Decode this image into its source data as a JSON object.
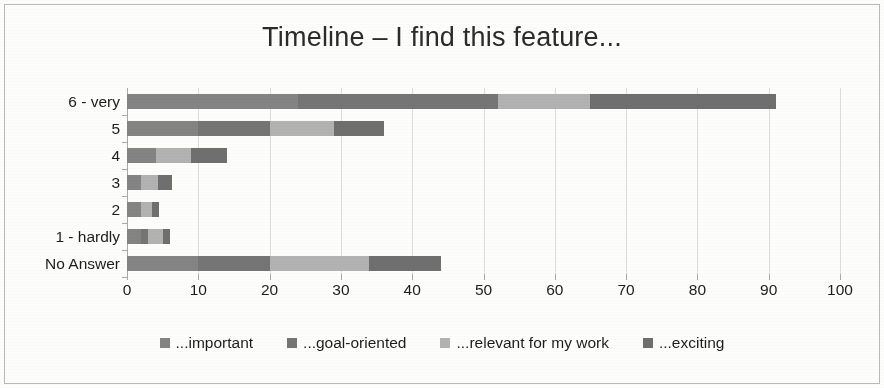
{
  "chart_data": {
    "type": "bar",
    "orientation": "horizontal",
    "stacked": true,
    "title": "Timeline – I find this feature...",
    "xlabel": "",
    "ylabel": "",
    "xlim": [
      0,
      100
    ],
    "xticks": [
      0,
      10,
      20,
      30,
      40,
      50,
      60,
      70,
      80,
      90,
      100
    ],
    "xtick_labels": [
      "0",
      "10",
      "20",
      "30",
      "40",
      "50",
      "60",
      "70",
      "80",
      "90",
      "100"
    ],
    "grid": true,
    "legend_position": "bottom",
    "categories": [
      "6 - very",
      "5",
      "4",
      "3",
      "2",
      "1 - hardly",
      "No Answer"
    ],
    "series": [
      {
        "name": "...important",
        "color": "#848484",
        "values": [
          24,
          10,
          4,
          2,
          2,
          2,
          10
        ]
      },
      {
        "name": "...goal-oriented",
        "color": "#757575",
        "values": [
          28,
          10,
          0,
          0,
          0,
          1,
          10
        ]
      },
      {
        "name": "...relevant for my work",
        "color": "#b2b2b2",
        "values": [
          13,
          9,
          5,
          2.4,
          1.5,
          2,
          14
        ]
      },
      {
        "name": "...exciting",
        "color": "#6f6f6f",
        "values": [
          26,
          7,
          5,
          1.9,
          1,
          1,
          10
        ]
      }
    ],
    "totals": [
      91,
      36,
      14,
      6.3,
      4.5,
      6,
      44
    ]
  },
  "legend": {
    "items": [
      {
        "label": "...important",
        "color": "#848484",
        "swatch": "square-swatch"
      },
      {
        "label": "...goal-oriented",
        "color": "#757575",
        "swatch": "square-swatch"
      },
      {
        "label": "...relevant for my work",
        "color": "#b2b2b2",
        "swatch": "square-swatch"
      },
      {
        "label": "...exciting",
        "color": "#6f6f6f",
        "swatch": "square-swatch"
      }
    ]
  },
  "style": {
    "background": "#fdfdfc",
    "border_color": "#b9b9b9",
    "grid_color": "#dcdcdc",
    "axis_color": "#a8a8a8",
    "text_color": "#1d1d1d"
  }
}
